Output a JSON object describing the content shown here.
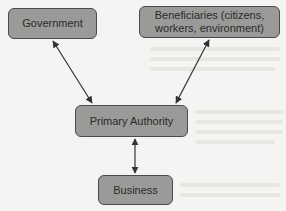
{
  "diagram": {
    "type": "flow",
    "nodes": [
      {
        "id": "government",
        "label": "Government"
      },
      {
        "id": "beneficiaries",
        "label": "Beneficiaries (citizens, workers, environment)"
      },
      {
        "id": "primary_authority",
        "label": "Primary Authority"
      },
      {
        "id": "business",
        "label": "Business"
      }
    ],
    "edges": [
      {
        "from": "government",
        "to": "primary_authority",
        "direction": "both"
      },
      {
        "from": "beneficiaries",
        "to": "primary_authority",
        "direction": "both"
      },
      {
        "from": "primary_authority",
        "to": "business",
        "direction": "both"
      }
    ],
    "colors": {
      "node_fill": "#9a9a98",
      "node_border": "#4a4a4a",
      "arrow": "#333333",
      "background": "#f4f4f2"
    }
  }
}
